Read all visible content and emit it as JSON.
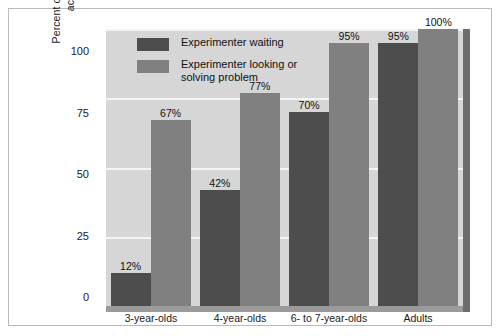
{
  "chart_data": {
    "type": "bar",
    "title": "",
    "subtitle": "",
    "xlabel": "",
    "ylabel_line1": "Percent of children attributing mental",
    "ylabel_line2": "activity to experimenter",
    "categories": [
      "3-year-olds",
      "4-year-olds",
      "6- to 7-year-olds",
      "Adults"
    ],
    "series": [
      {
        "name": "Experimenter waiting",
        "color": "#4d4d4d",
        "values": [
          12,
          42,
          70,
          95
        ],
        "labels": [
          "12%",
          "42%",
          "70%",
          "95%"
        ]
      },
      {
        "name": "Experimenter looking or solving problem",
        "name_line1": "Experimenter looking or",
        "name_line2": "solving problem",
        "color": "#808080",
        "values": [
          67,
          77,
          95,
          100
        ],
        "labels": [
          "67%",
          "77%",
          "95%",
          "100%"
        ]
      }
    ],
    "ylim": [
      0,
      100
    ],
    "yticks": [
      0,
      25,
      50,
      75,
      100
    ],
    "ytick_labels": [
      "0",
      "25",
      "50",
      "75",
      "100"
    ],
    "grid": true,
    "legend_position": "top-left-inside",
    "plot_background": "#d6d6d6",
    "gridline_color": "#f4f4f4",
    "frame_color": "#b9b9b9"
  }
}
